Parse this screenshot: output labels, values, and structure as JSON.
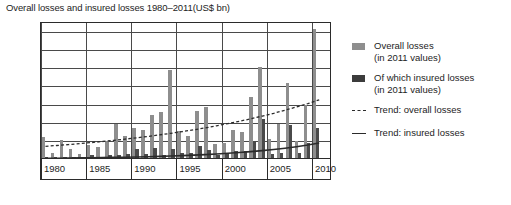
{
  "title": "Overall losses and insured losses 1980–2011(US$ bn)",
  "legend": {
    "items": [
      {
        "name": "overall-losses",
        "marker": "light-gray-swatch",
        "label": "Overall losses",
        "sublabel": "(in 2011 values)"
      },
      {
        "name": "insured-losses",
        "marker": "dark-gray-swatch",
        "label": "Of which insured losses",
        "sublabel": "(in 2011 values)"
      },
      {
        "name": "trend-overall",
        "marker": "dashed-line",
        "label": "Trend: overall losses",
        "sublabel": ""
      },
      {
        "name": "trend-insured",
        "marker": "solid-line",
        "label": "Trend: insured losses",
        "sublabel": ""
      }
    ]
  },
  "chart_data": {
    "type": "bar",
    "title": "Overall losses and insured losses 1980–2011(US$ bn)",
    "xlabel": "",
    "ylabel": "",
    "ylim": [
      0,
      375
    ],
    "yticks": [
      0,
      50,
      100,
      150,
      200,
      250,
      300,
      350
    ],
    "ytick_labels": [
      "0",
      "50",
      "100",
      "150",
      "200",
      "250",
      "300",
      "350"
    ],
    "xticks": [
      1980,
      1985,
      1990,
      1995,
      2000,
      2005,
      2010
    ],
    "xtick_labels": [
      "1980",
      "1985",
      "1990",
      "1995",
      "2000",
      "2005",
      "2010"
    ],
    "grid": true,
    "legend_position": "right",
    "x": [
      1980,
      1981,
      1982,
      1983,
      1984,
      1985,
      1986,
      1987,
      1988,
      1989,
      1990,
      1991,
      1992,
      1993,
      1994,
      1995,
      1996,
      1997,
      1998,
      1999,
      2000,
      2001,
      2002,
      2003,
      2004,
      2005,
      2006,
      2007,
      2008,
      2009,
      2010,
      2011
    ],
    "series": [
      {
        "name": "Overall losses (in 2011 values)",
        "color": "#8e8e8e",
        "values": [
          57,
          14,
          50,
          26,
          11,
          35,
          30,
          47,
          93,
          62,
          84,
          78,
          118,
          127,
          243,
          75,
          60,
          130,
          140,
          40,
          41,
          78,
          72,
          167,
          250,
          52,
          93,
          208,
          47,
          145,
          357,
          0
        ]
      },
      {
        "name": "Of which insured losses (in 2011 values)",
        "color": "#4a4a4a",
        "values": [
          3,
          2,
          2,
          3,
          2,
          7,
          4,
          9,
          9,
          12,
          26,
          12,
          28,
          8,
          25,
          15,
          14,
          32,
          22,
          9,
          14,
          18,
          20,
          44,
          107,
          11,
          14,
          90,
          15,
          41,
          82,
          0
        ]
      }
    ],
    "trend_overall": {
      "name": "Trend: overall losses",
      "style": "dashed",
      "color": "#2b2b2b",
      "start_value": 35,
      "end_value": 163
    },
    "trend_insured": {
      "name": "Trend: insured losses",
      "style": "solid",
      "color": "#2b2b2b",
      "start_value": 2,
      "end_value": 44
    }
  }
}
